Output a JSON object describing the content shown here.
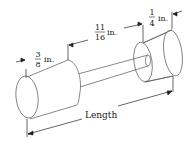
{
  "diagram": {
    "labels": {
      "left_width": {
        "num": "3",
        "den": "8",
        "unit": "in."
      },
      "gap": {
        "num": "11",
        "den": "16",
        "unit": "in."
      },
      "right_width": {
        "num": "1",
        "den": "4",
        "unit": "in."
      },
      "overall": "Length"
    },
    "colors": {
      "line": "#3a3a3a",
      "text": "#1a1a1a",
      "background": "#ffffff"
    }
  }
}
